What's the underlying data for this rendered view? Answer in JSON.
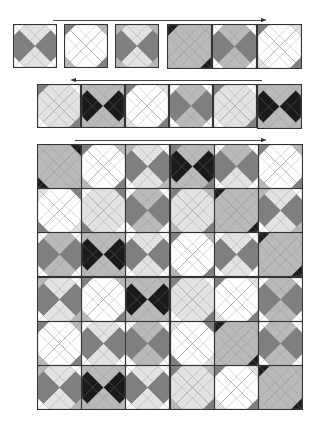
{
  "palette": {
    "W": "#ffffff",
    "L": "#e2e2e2",
    "M": "#b9b9b9",
    "D": "#7f7f7f",
    "K": "#1a1a1a"
  },
  "arrows": [
    {
      "id": "arrow-row1",
      "direction": "right",
      "x1": 53,
      "x2": 262,
      "y": 20
    },
    {
      "id": "arrow-row2",
      "direction": "left",
      "x1": 75,
      "x2": 262,
      "y": 80
    },
    {
      "id": "arrow-grid",
      "direction": "right",
      "x1": 75,
      "x2": 262,
      "y": 140
    }
  ],
  "row1": {
    "description": "Six single quilt blocks; first three separated, last three joined",
    "tiles": [
      {
        "x": 13,
        "y": 24,
        "s": 44,
        "t": "L",
        "r": "D",
        "b": "L",
        "l": "D",
        "c": [
          "W",
          "W",
          "W",
          "W"
        ]
      },
      {
        "x": 64,
        "y": 24,
        "s": 44,
        "t": "W",
        "r": "W",
        "b": "W",
        "l": "W",
        "c": [
          "D",
          "M",
          "D",
          "M"
        ]
      },
      {
        "x": 115,
        "y": 24,
        "s": 44,
        "t": "L",
        "r": "D",
        "b": "L",
        "l": "D",
        "c": [
          "M",
          "M",
          "M",
          "M"
        ]
      },
      {
        "x": 167,
        "y": 24,
        "s": 45,
        "t": "M",
        "r": "M",
        "b": "M",
        "l": "M",
        "c": [
          "K",
          "M",
          "K",
          "M"
        ]
      },
      {
        "x": 212,
        "y": 24,
        "s": 45,
        "t": "M",
        "r": "D",
        "b": "M",
        "l": "D",
        "c": [
          "W",
          "W",
          "W",
          "W"
        ]
      },
      {
        "x": 257,
        "y": 24,
        "s": 45,
        "t": "W",
        "r": "W",
        "b": "W",
        "l": "W",
        "c": [
          "D",
          "L",
          "D",
          "L"
        ]
      }
    ]
  },
  "row2": {
    "description": "Six joined blocks",
    "tiles": [
      {
        "x": 37,
        "y": 84,
        "s": 44,
        "t": "L",
        "r": "L",
        "b": "L",
        "l": "L",
        "c": [
          "D",
          "W",
          "D",
          "W"
        ]
      },
      {
        "x": 81,
        "y": 84,
        "s": 44,
        "t": "M",
        "r": "K",
        "b": "M",
        "l": "K",
        "c": [
          "M",
          "M",
          "M",
          "M"
        ]
      },
      {
        "x": 125,
        "y": 84,
        "s": 44,
        "t": "W",
        "r": "W",
        "b": "W",
        "l": "W",
        "c": [
          "D",
          "L",
          "D",
          "L"
        ]
      },
      {
        "x": 169,
        "y": 84,
        "s": 44,
        "t": "M",
        "r": "D",
        "b": "M",
        "l": "D",
        "c": [
          "W",
          "W",
          "W",
          "W"
        ]
      },
      {
        "x": 213,
        "y": 84,
        "s": 44,
        "t": "L",
        "r": "L",
        "b": "L",
        "l": "L",
        "c": [
          "D",
          "W",
          "D",
          "W"
        ]
      },
      {
        "x": 257,
        "y": 84,
        "s": 45,
        "t": "M",
        "r": "K",
        "b": "M",
        "l": "K",
        "c": [
          "M",
          "M",
          "M",
          "M"
        ]
      }
    ]
  },
  "grid": {
    "description": "6x6 assembled quilt",
    "x": 37,
    "y": 144,
    "cell": 44.2,
    "rows": [
      [
        {
          "t": "M",
          "r": "M",
          "b": "M",
          "l": "M",
          "c": [
            "M",
            "K",
            "M",
            "K"
          ]
        },
        {
          "t": "W",
          "r": "W",
          "b": "W",
          "l": "W",
          "c": [
            "D",
            "M",
            "D",
            "M"
          ]
        },
        {
          "t": "L",
          "r": "D",
          "b": "L",
          "l": "D",
          "c": [
            "M",
            "W",
            "M",
            "W"
          ]
        },
        {
          "t": "M",
          "r": "K",
          "b": "M",
          "l": "K",
          "c": [
            "D",
            "M",
            "D",
            "M"
          ]
        },
        {
          "t": "M",
          "r": "D",
          "b": "L",
          "l": "D",
          "c": [
            "W",
            "W",
            "W",
            "W"
          ]
        },
        {
          "t": "W",
          "r": "W",
          "b": "W",
          "l": "W",
          "c": [
            "D",
            "M",
            "D",
            "M"
          ]
        }
      ],
      [
        {
          "t": "W",
          "r": "W",
          "b": "W",
          "l": "W",
          "c": [
            "L",
            "D",
            "L",
            "D"
          ]
        },
        {
          "t": "L",
          "r": "L",
          "b": "L",
          "l": "L",
          "c": [
            "W",
            "D",
            "W",
            "D"
          ]
        },
        {
          "t": "M",
          "r": "D",
          "b": "M",
          "l": "D",
          "c": [
            "W",
            "W",
            "W",
            "W"
          ]
        },
        {
          "t": "L",
          "r": "L",
          "b": "L",
          "l": "L",
          "c": [
            "D",
            "M",
            "D",
            "M"
          ]
        },
        {
          "t": "M",
          "r": "M",
          "b": "M",
          "l": "M",
          "c": [
            "K",
            "M",
            "K",
            "M"
          ]
        },
        {
          "t": "L",
          "r": "D",
          "b": "L",
          "l": "D",
          "c": [
            "M",
            "W",
            "M",
            "W"
          ]
        }
      ],
      [
        {
          "t": "M",
          "r": "D",
          "b": "M",
          "l": "D",
          "c": [
            "W",
            "W",
            "W",
            "W"
          ]
        },
        {
          "t": "M",
          "r": "K",
          "b": "M",
          "l": "K",
          "c": [
            "M",
            "M",
            "M",
            "M"
          ]
        },
        {
          "t": "L",
          "r": "D",
          "b": "L",
          "l": "D",
          "c": [
            "W",
            "W",
            "W",
            "W"
          ]
        },
        {
          "t": "W",
          "r": "W",
          "b": "W",
          "l": "W",
          "c": [
            "D",
            "M",
            "D",
            "M"
          ]
        },
        {
          "t": "L",
          "r": "D",
          "b": "L",
          "l": "D",
          "c": [
            "W",
            "W",
            "W",
            "W"
          ]
        },
        {
          "t": "M",
          "r": "M",
          "b": "M",
          "l": "M",
          "c": [
            "K",
            "M",
            "K",
            "M"
          ]
        }
      ],
      [
        {
          "t": "L",
          "r": "D",
          "b": "L",
          "l": "D",
          "c": [
            "M",
            "W",
            "M",
            "W"
          ]
        },
        {
          "t": "W",
          "r": "W",
          "b": "W",
          "l": "W",
          "c": [
            "D",
            "M",
            "D",
            "M"
          ]
        },
        {
          "t": "M",
          "r": "K",
          "b": "M",
          "l": "K",
          "c": [
            "M",
            "M",
            "M",
            "M"
          ]
        },
        {
          "t": "L",
          "r": "L",
          "b": "L",
          "l": "L",
          "c": [
            "D",
            "W",
            "D",
            "W"
          ]
        },
        {
          "t": "W",
          "r": "W",
          "b": "W",
          "l": "W",
          "c": [
            "D",
            "L",
            "D",
            "L"
          ]
        },
        {
          "t": "M",
          "r": "D",
          "b": "M",
          "l": "D",
          "c": [
            "W",
            "W",
            "W",
            "W"
          ]
        }
      ],
      [
        {
          "t": "W",
          "r": "W",
          "b": "W",
          "l": "W",
          "c": [
            "D",
            "M",
            "D",
            "M"
          ]
        },
        {
          "t": "L",
          "r": "D",
          "b": "L",
          "l": "D",
          "c": [
            "W",
            "W",
            "W",
            "W"
          ]
        },
        {
          "t": "M",
          "r": "D",
          "b": "M",
          "l": "D",
          "c": [
            "W",
            "W",
            "W",
            "W"
          ]
        },
        {
          "t": "W",
          "r": "W",
          "b": "W",
          "l": "W",
          "c": [
            "L",
            "D",
            "L",
            "D"
          ]
        },
        {
          "t": "M",
          "r": "M",
          "b": "M",
          "l": "M",
          "c": [
            "K",
            "M",
            "K",
            "M"
          ]
        },
        {
          "t": "M",
          "r": "D",
          "b": "M",
          "l": "D",
          "c": [
            "W",
            "W",
            "W",
            "W"
          ]
        }
      ],
      [
        {
          "t": "L",
          "r": "D",
          "b": "L",
          "l": "D",
          "c": [
            "M",
            "W",
            "M",
            "W"
          ]
        },
        {
          "t": "M",
          "r": "K",
          "b": "M",
          "l": "K",
          "c": [
            "M",
            "M",
            "M",
            "M"
          ]
        },
        {
          "t": "L",
          "r": "D",
          "b": "L",
          "l": "D",
          "c": [
            "W",
            "W",
            "W",
            "W"
          ]
        },
        {
          "t": "L",
          "r": "L",
          "b": "L",
          "l": "L",
          "c": [
            "D",
            "M",
            "D",
            "M"
          ]
        },
        {
          "t": "W",
          "r": "W",
          "b": "W",
          "l": "W",
          "c": [
            "D",
            "L",
            "D",
            "L"
          ]
        },
        {
          "t": "M",
          "r": "M",
          "b": "M",
          "l": "M",
          "c": [
            "K",
            "M",
            "K",
            "M"
          ]
        }
      ]
    ]
  }
}
